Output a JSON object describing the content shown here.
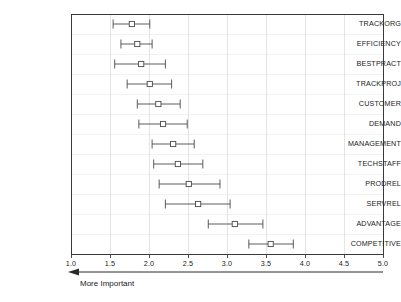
{
  "chart_data": {
    "type": "scatter",
    "title": "",
    "xlabel": "",
    "ylabel": "",
    "xlim": [
      1.0,
      5.0
    ],
    "grid": true,
    "legend": null,
    "annotation": {
      "text": "More Important",
      "arrow_direction": "left"
    },
    "xticks": [
      "1.0",
      "1.5",
      "2.0",
      "2.5",
      "3.0",
      "3.5",
      "4.0",
      "4.5",
      "5.0"
    ],
    "xtick_values": [
      1.0,
      1.5,
      2.0,
      2.5,
      3.0,
      3.5,
      4.0,
      4.5,
      5.0
    ],
    "categories": [
      "TRACKORG",
      "EFFICIENCY",
      "BESTPRACT",
      "TRACKPROJ",
      "CUSTOMER",
      "DEMAND",
      "MANAGEMENT",
      "TECHSTAFF",
      "PRODREL",
      "SERVREL",
      "ADVANTAGE",
      "COMPETITIVE"
    ],
    "points": [
      {
        "category": "TRACKORG",
        "mean": 1.78,
        "low": 1.54,
        "high": 2.01
      },
      {
        "category": "EFFICIENCY",
        "mean": 1.85,
        "low": 1.64,
        "high": 2.04
      },
      {
        "category": "BESTPRACT",
        "mean": 1.9,
        "low": 1.56,
        "high": 2.21
      },
      {
        "category": "TRACKPROJ",
        "mean": 2.01,
        "low": 1.72,
        "high": 2.29
      },
      {
        "category": "CUSTOMER",
        "mean": 2.12,
        "low": 1.85,
        "high": 2.4
      },
      {
        "category": "DEMAND",
        "mean": 2.18,
        "low": 1.87,
        "high": 2.49
      },
      {
        "category": "MANAGEMENT",
        "mean": 2.31,
        "low": 2.04,
        "high": 2.58
      },
      {
        "category": "TECHSTAFF",
        "mean": 2.37,
        "low": 2.06,
        "high": 2.69
      },
      {
        "category": "PRODREL",
        "mean": 2.51,
        "low": 2.13,
        "high": 2.91
      },
      {
        "category": "SERVREL",
        "mean": 2.63,
        "low": 2.21,
        "high": 3.04
      },
      {
        "category": "ADVANTAGE",
        "mean": 3.1,
        "low": 2.76,
        "high": 3.46
      },
      {
        "category": "COMPETITIVE",
        "mean": 3.56,
        "low": 3.28,
        "high": 3.85
      }
    ]
  },
  "colors": {
    "axis": "#3a3a3a",
    "grid": "#c9c9c9",
    "series": "#4a4a4a",
    "text": "#222222",
    "background": "#ffffff"
  }
}
